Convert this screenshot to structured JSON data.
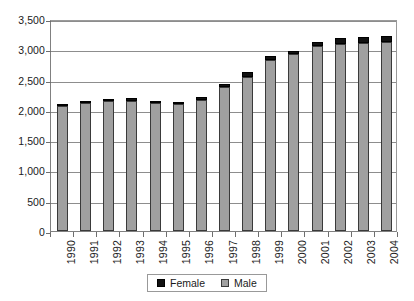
{
  "chart_data": {
    "type": "bar",
    "stacked": true,
    "title": "",
    "subtitle": "",
    "xlabel": "",
    "ylabel": "",
    "grid": true,
    "legend_position": "bottom",
    "ylim": [
      0,
      3500
    ],
    "ytick_step": 500,
    "ytick_labels": [
      "3,500",
      "3,000",
      "2,500",
      "2,000",
      "1,500",
      "1,000",
      "500",
      "0"
    ],
    "ytick_values": [
      3500,
      3000,
      2500,
      2000,
      1500,
      1000,
      500,
      0
    ],
    "categories": [
      "1990",
      "1991",
      "1992",
      "1993",
      "1994",
      "1995",
      "1996",
      "1997",
      "1998",
      "1999",
      "2000",
      "2001",
      "2002",
      "2003",
      "2004"
    ],
    "series": [
      {
        "name": "Male",
        "color": "#a0a0a0",
        "values": [
          2060,
          2110,
          2140,
          2140,
          2115,
          2095,
          2165,
          2375,
          2540,
          2820,
          2920,
          3060,
          3090,
          3110,
          3115
        ]
      },
      {
        "name": "Female",
        "color": "#111111",
        "values": [
          45,
          40,
          45,
          50,
          25,
          40,
          40,
          60,
          80,
          70,
          55,
          65,
          90,
          90,
          105
        ]
      }
    ],
    "totals": [
      2105,
      2150,
      2185,
      2190,
      2140,
      2135,
      2205,
      2435,
      2620,
      2890,
      2975,
      3125,
      3180,
      3200,
      3220
    ]
  },
  "legend": {
    "items": [
      {
        "label": "Female",
        "swatch": "female-swatch"
      },
      {
        "label": "Male",
        "swatch": "male-swatch"
      }
    ]
  }
}
